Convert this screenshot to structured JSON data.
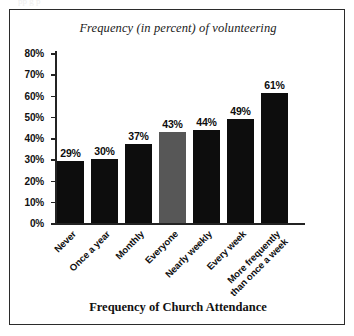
{
  "page": {
    "bleed_text": "pp       g                         p"
  },
  "chart_data": {
    "type": "bar",
    "title": "Frequency (in percent) of volunteering",
    "xlabel": "Frequency of Church Attendance",
    "ylabel": "",
    "categories": [
      "Never",
      "Once a year",
      "Monthly",
      "Everyone",
      "Nearly weekly",
      "Every week",
      "More frequently\nthan once a week"
    ],
    "values": [
      29,
      30,
      37,
      43,
      44,
      49,
      61
    ],
    "value_labels": [
      "29%",
      "30%",
      "37%",
      "43%",
      "44%",
      "49%",
      "61%"
    ],
    "ylim": [
      0,
      80
    ],
    "ytick_labels": [
      "80%",
      "70%",
      "60%",
      "50%",
      "40%",
      "30%",
      "20%",
      "10%",
      "0%"
    ],
    "ytick_values": [
      80,
      70,
      60,
      50,
      40,
      30,
      20,
      10,
      0
    ],
    "grid": false,
    "legend": "none",
    "bar_colors": [
      "#0d0d0d",
      "#0d0d0d",
      "#0d0d0d",
      "#575757",
      "#0d0d0d",
      "#0d0d0d",
      "#0d0d0d"
    ],
    "highlight_category": "Everyone",
    "highlight_color": "#575757",
    "bar_color": "#0d0d0d"
  }
}
